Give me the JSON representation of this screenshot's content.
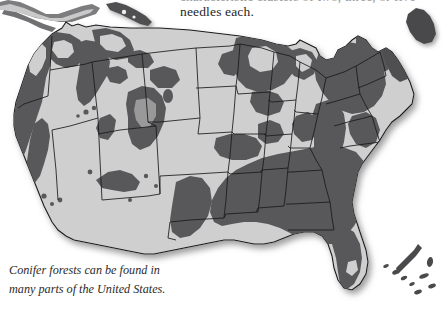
{
  "page": {
    "width": 444,
    "height": 312,
    "background": "#ffffff"
  },
  "body_text": {
    "cut_off_line": "characteristic clusters of two, three, or five",
    "visible_line": "needles each."
  },
  "figure": {
    "caption_line_1": "Conifer forests can be found in",
    "caption_line_2": "many parts of the United States.",
    "caption_full": "Conifer forests can be found in many parts of the United States.",
    "map_title": "United States conifer forest distribution",
    "subject": "United States",
    "alt": "Grayscale map of the contiguous United States with dark shading marking regions where conifer forests grow"
  },
  "legend": {
    "forest_label": "Conifer forest",
    "land_label": "Other land",
    "state_border_label": "State border"
  },
  "colors": {
    "page_background": "#ffffff",
    "land_light": "#cfcfcf",
    "land_light_shade": "#c4c4c4",
    "forest_dark": "#58585a",
    "forest_dark_shade": "#4b4b4d",
    "border_line": "#1a1a1a",
    "drop_shadow": "#9e9e9e",
    "text": "#262626",
    "caption_text": "#2b2b2b",
    "faded_text": "#9a9a9a"
  },
  "regions": [
    {
      "name": "Pacific Northwest",
      "forest_coverage": "high"
    },
    {
      "name": "Northern Rockies",
      "forest_coverage": "high"
    },
    {
      "name": "Sierra Nevada",
      "forest_coverage": "moderate"
    },
    {
      "name": "Southern Rockies",
      "forest_coverage": "moderate"
    },
    {
      "name": "Great Plains",
      "forest_coverage": "low"
    },
    {
      "name": "Great Lakes",
      "forest_coverage": "high"
    },
    {
      "name": "Northeast",
      "forest_coverage": "high"
    },
    {
      "name": "Appalachians",
      "forest_coverage": "moderate"
    },
    {
      "name": "Southeast Coastal Plain",
      "forest_coverage": "high"
    },
    {
      "name": "Florida",
      "forest_coverage": "high"
    },
    {
      "name": "Southwest Desert",
      "forest_coverage": "low"
    }
  ]
}
